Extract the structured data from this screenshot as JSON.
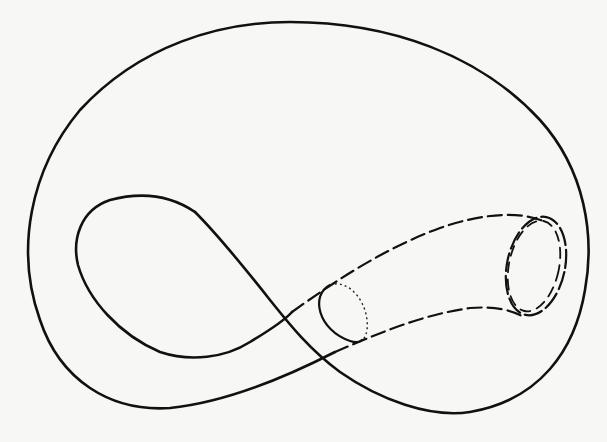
{
  "figure": {
    "stroke_color": "#111111",
    "background_color": "#f7f7f5",
    "elements": [
      {
        "name": "outer-body",
        "style": "solid"
      },
      {
        "name": "inner-loop-handle",
        "style": "solid"
      },
      {
        "name": "tube-upper-edge",
        "style": "dashed"
      },
      {
        "name": "tube-lower-edge",
        "style": "dashed"
      },
      {
        "name": "small-tube-opening",
        "style": "solid-and-dotted"
      },
      {
        "name": "large-tube-opening",
        "style": "double-dashed"
      }
    ]
  }
}
